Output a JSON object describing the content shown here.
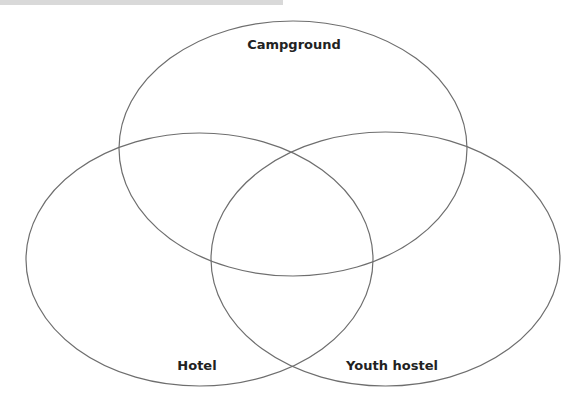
{
  "diagram": {
    "type": "venn",
    "stroke_color": "#6e6e6e",
    "background_color": "#ffffff",
    "top_bar_color": "#d9d9d9",
    "sets": [
      {
        "id": "campground",
        "label": "Campground",
        "ellipse": {
          "cx": 293,
          "cy": 148.5,
          "rx": 174,
          "ry": 127.5
        },
        "label_pos": {
          "x": 294,
          "y": 37
        }
      },
      {
        "id": "hotel",
        "label": "Hotel",
        "ellipse": {
          "cx": 199.5,
          "cy": 259.5,
          "rx": 173.5,
          "ry": 126.5
        },
        "label_pos": {
          "x": 197,
          "y": 358
        }
      },
      {
        "id": "youth-hostel",
        "label": "Youth hostel",
        "ellipse": {
          "cx": 385.5,
          "cy": 259,
          "rx": 174.5,
          "ry": 127
        },
        "label_pos": {
          "x": 392,
          "y": 358
        }
      }
    ]
  }
}
